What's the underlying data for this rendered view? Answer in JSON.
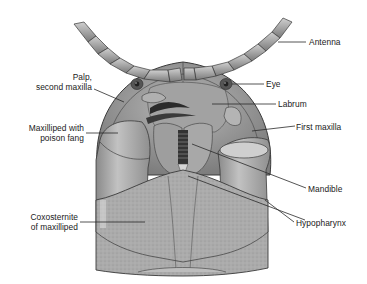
{
  "figure": {
    "colors": {
      "background": "#ffffff",
      "body_fill": "#a9a9a9",
      "body_light": "#c8c8c8",
      "body_dark": "#6f6f6f",
      "outline": "#3a3a3a",
      "leader_line": "#2a2a2a",
      "label_text": "#1a1a1a"
    },
    "labels": [
      {
        "id": "antenna",
        "text": "Antenna",
        "side": "right"
      },
      {
        "id": "eye",
        "text": "Eye",
        "side": "right"
      },
      {
        "id": "palp",
        "text": [
          "Palp,",
          "second maxilla"
        ],
        "side": "left"
      },
      {
        "id": "labrum",
        "text": "Labrum",
        "side": "right"
      },
      {
        "id": "maxilliped",
        "text": [
          "Maxilliped with",
          "poison fang"
        ],
        "side": "left"
      },
      {
        "id": "first_maxilla",
        "text": "First maxilla",
        "side": "right"
      },
      {
        "id": "mandible",
        "text": "Mandible",
        "side": "right"
      },
      {
        "id": "coxosternite",
        "text": [
          "Coxosternite",
          "of maxilliped"
        ],
        "side": "left"
      },
      {
        "id": "hypopharynx",
        "text": "Hypopharynx",
        "side": "right"
      }
    ]
  }
}
